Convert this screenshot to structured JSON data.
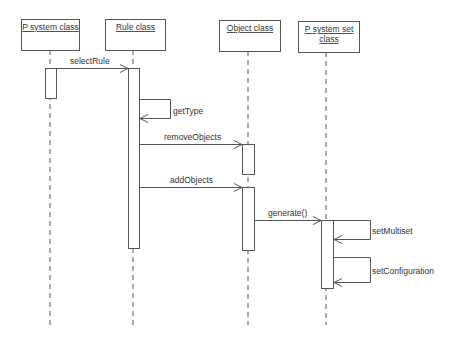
{
  "diagram": {
    "type": "UML sequence diagram",
    "colors": {
      "stroke": "#555555",
      "text": "#333333",
      "background": "#ffffff"
    },
    "participants": [
      {
        "id": "p_system",
        "title_lines": [
          "P system class"
        ],
        "box": [
          21,
          19,
          58,
          31
        ],
        "lifeline_x": 50
      },
      {
        "id": "rule",
        "title_lines": [
          "Rule class"
        ],
        "box": [
          105,
          19,
          60,
          31
        ],
        "lifeline_x": 133
      },
      {
        "id": "object",
        "title_lines": [
          "Object class"
        ],
        "box": [
          219,
          20,
          61,
          31
        ],
        "lifeline_x": 248
      },
      {
        "id": "p_system_set",
        "title_lines": [
          "P system set",
          "class"
        ],
        "box": [
          298,
          21,
          61,
          31
        ],
        "lifeline_x": 326
      }
    ],
    "lifeline_end_y": 325,
    "activations": [
      {
        "participant": "p_system",
        "x": 45,
        "y": 68,
        "w": 11,
        "h": 30
      },
      {
        "participant": "rule",
        "x": 128,
        "y": 68,
        "w": 11,
        "h": 180
      },
      {
        "participant": "object",
        "x": 242,
        "y": 144,
        "w": 12,
        "h": 30
      },
      {
        "participant": "object",
        "x": 242,
        "y": 187,
        "w": 12,
        "h": 63
      },
      {
        "participant": "p_system_set",
        "x": 321,
        "y": 220,
        "w": 12,
        "h": 68
      }
    ],
    "messages": [
      {
        "label": "selectRule",
        "from": "p_system",
        "to": "rule",
        "kind": "call",
        "x1": 56,
        "x2": 128,
        "y": 68,
        "label_x": 70,
        "label_y": 64
      },
      {
        "label": "getType",
        "from": "rule",
        "to": "rule",
        "kind": "self",
        "x": 139,
        "y1": 99,
        "y2": 118,
        "loop_x": 170,
        "label_x": 173,
        "label_y": 114
      },
      {
        "label": "removeObjects",
        "from": "rule",
        "to": "object",
        "kind": "call",
        "x1": 139,
        "x2": 242,
        "y": 144,
        "label_x": 164,
        "label_y": 140
      },
      {
        "label": "addObjects",
        "from": "rule",
        "to": "object",
        "kind": "call",
        "x1": 139,
        "x2": 242,
        "y": 187,
        "label_x": 170,
        "label_y": 183
      },
      {
        "label": "generate()",
        "from": "object",
        "to": "p_system_set",
        "kind": "call",
        "x1": 254,
        "x2": 321,
        "y": 220,
        "label_x": 268,
        "label_y": 216
      },
      {
        "label": "setMultiset",
        "from": "p_system_set",
        "to": "p_system_set",
        "kind": "self",
        "x": 333,
        "y1": 220,
        "y2": 239,
        "loop_x": 370,
        "label_x": 372,
        "label_y": 234
      },
      {
        "label": "setConfiguration",
        "from": "p_system_set",
        "to": "p_system_set",
        "kind": "self",
        "x": 333,
        "y1": 257,
        "y2": 282,
        "loop_x": 370,
        "label_x": 372,
        "label_y": 274
      }
    ]
  }
}
